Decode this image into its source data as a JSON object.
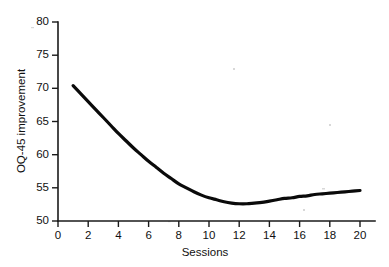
{
  "figure": {
    "background_color": "#ffffff",
    "ink_color": "#0a0a0a"
  },
  "chart_data": {
    "type": "line",
    "title": "",
    "subtitle": "",
    "xlabel": "Sessions",
    "ylabel": "OQ-45 improvement",
    "xlim": [
      0,
      20.8
    ],
    "ylim": [
      50,
      80
    ],
    "xticks": [
      0,
      2,
      4,
      6,
      8,
      10,
      12,
      14,
      16,
      18,
      20
    ],
    "xtick_labels": [
      "0",
      "2",
      "4",
      "6",
      "8",
      "10",
      "12",
      "14",
      "16",
      "18",
      "20"
    ],
    "yticks": [
      50,
      55,
      60,
      65,
      70,
      75,
      80
    ],
    "ytick_labels": [
      "50",
      "55",
      "60",
      "65",
      "70",
      "75",
      "80"
    ],
    "grid": false,
    "legend": false,
    "legend_position": "none",
    "series": [
      {
        "name": "OQ-45 improvement",
        "color": "#0a0a0a",
        "line_width": 3.2,
        "x": [
          1.0,
          1.5,
          2.0,
          2.5,
          3.0,
          3.5,
          4.0,
          4.5,
          5.0,
          5.5,
          6.0,
          6.5,
          7.0,
          7.5,
          8.0,
          8.5,
          9.0,
          9.5,
          10.0,
          10.5,
          11.0,
          11.5,
          12.0,
          12.5,
          13.0,
          13.5,
          14.0,
          14.5,
          15.0,
          15.5,
          16.0,
          16.5,
          17.0,
          17.5,
          18.0,
          18.5,
          19.0,
          19.5,
          20.0
        ],
        "values": [
          70.4,
          69.2,
          68.0,
          66.8,
          65.6,
          64.4,
          63.2,
          62.1,
          61.0,
          60.0,
          59.0,
          58.1,
          57.2,
          56.4,
          55.6,
          55.0,
          54.4,
          53.9,
          53.5,
          53.2,
          52.9,
          52.7,
          52.6,
          52.6,
          52.7,
          52.8,
          53.0,
          53.2,
          53.4,
          53.5,
          53.7,
          53.8,
          54.0,
          54.1,
          54.2,
          54.3,
          54.4,
          54.5,
          54.6
        ]
      }
    ],
    "annotations": []
  }
}
